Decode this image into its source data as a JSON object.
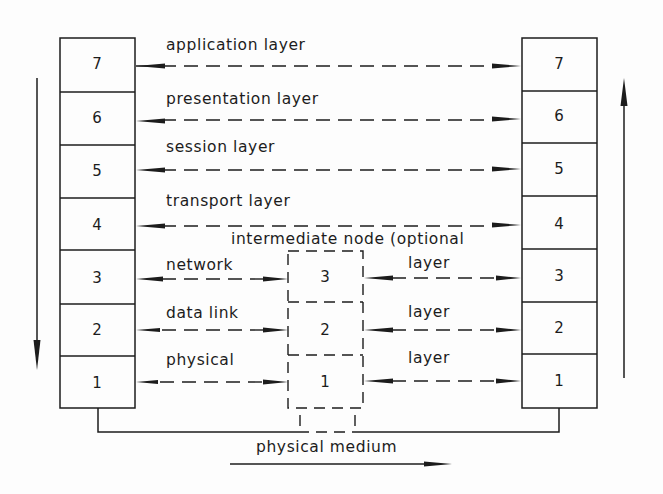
{
  "diagram": {
    "left_stack": {
      "layers": [
        "7",
        "6",
        "5",
        "4",
        "3",
        "2",
        "1"
      ],
      "direction": "down"
    },
    "right_stack": {
      "layers": [
        "7",
        "6",
        "5",
        "4",
        "3",
        "2",
        "1"
      ],
      "direction": "up"
    },
    "peer_links": [
      {
        "layer": "7",
        "label": "application layer"
      },
      {
        "layer": "6",
        "label": "presentation layer"
      },
      {
        "layer": "5",
        "label": "session layer"
      },
      {
        "layer": "4",
        "label": "transport layer"
      }
    ],
    "intermediate_node": {
      "caption": "intermediate node (optional",
      "layers": [
        "3",
        "2",
        "1"
      ],
      "left_labels": [
        "network",
        "data link",
        "physical"
      ],
      "right_labels": [
        "layer",
        "layer",
        "layer"
      ]
    },
    "medium": {
      "label": "physical medium"
    },
    "colors": {
      "ink": "#1c1c1c",
      "paper": "#fdfdfd"
    }
  }
}
